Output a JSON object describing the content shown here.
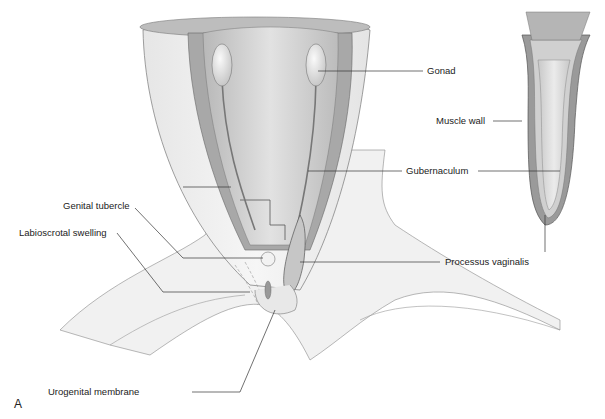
{
  "figure": {
    "panel_label": "A",
    "labels": {
      "gonad": "Gonad",
      "muscle_wall": "Muscle wall",
      "gubernaculum": "Gubernaculum",
      "genital_tubercle": "Genital tubercle",
      "labioscrotal_swelling": "Labioscrotal swelling",
      "processus_vaginalis": "Processus vaginalis",
      "urogenital_membrane": "Urogenital membrane"
    },
    "colors": {
      "outer_wall": "#ececec",
      "muscle_layer": "#a9a9a9",
      "inner_cavity": "#cfcfcf",
      "leader_line": "#333333"
    }
  }
}
